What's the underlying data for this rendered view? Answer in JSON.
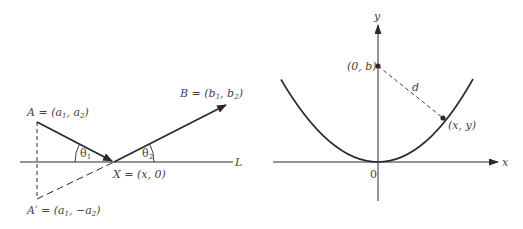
{
  "colors": {
    "background": "#ffffff",
    "stroke": "#2a2a2a",
    "label": "#444444"
  },
  "left_diagram": {
    "point_A_label": "A = (a",
    "point_A_sub1": "1",
    "point_A_mid": ", a",
    "point_A_sub2": "2",
    "point_A_end": ")",
    "point_B_label": "B = (b",
    "point_B_sub1": "1",
    "point_B_mid": ", b",
    "point_B_sub2": "2",
    "point_B_end": ")",
    "point_X_label": "X = (x, 0)",
    "point_Aprime_label": "A′ = (a",
    "point_Aprime_sub1": "1",
    "point_Aprime_mid": ", −a",
    "point_Aprime_sub2": "2",
    "point_Aprime_end": ")",
    "line_label": "L",
    "angle1_label": "θ",
    "angle1_sub": "1",
    "angle2_label": "θ",
    "angle2_sub": "2"
  },
  "right_diagram": {
    "x_axis_label": "x",
    "y_axis_label": "y",
    "origin_label": "0",
    "focus_label": "(0, b)",
    "curve_point_label": "(x, y)",
    "distance_label": "d"
  }
}
